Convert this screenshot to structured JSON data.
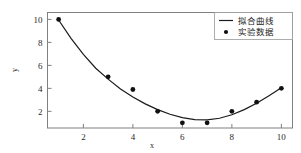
{
  "chart_data": {
    "type": "scatter",
    "title": "",
    "xlabel": "x",
    "ylabel": "y",
    "xlim": [
      0.55,
      10.45
    ],
    "ylim": [
      0.55,
      10.6
    ],
    "xticks": [
      2,
      4,
      6,
      8,
      10
    ],
    "yticks": [
      2,
      4,
      6,
      8,
      10
    ],
    "grid": false,
    "legend_position": "upper right",
    "series": [
      {
        "name": "拟合曲线",
        "type": "line",
        "marker": "line-sample",
        "color": "#1a1a1a",
        "equation_note": "quadratic fit",
        "x": [
          1.0,
          1.5,
          2.0,
          2.5,
          3.0,
          3.5,
          4.0,
          4.5,
          5.0,
          5.5,
          6.0,
          6.5,
          7.0,
          7.5,
          8.0,
          8.5,
          9.0,
          9.5,
          10.0
        ],
        "values": [
          9.95,
          8.35,
          6.95,
          5.75,
          4.8,
          3.95,
          3.25,
          2.65,
          2.15,
          1.75,
          1.45,
          1.28,
          1.25,
          1.4,
          1.7,
          2.15,
          2.7,
          3.35,
          4.05
        ]
      },
      {
        "name": "实验数据",
        "type": "scatter",
        "marker": "filled-circle",
        "color": "#111111",
        "x": [
          1,
          3,
          4,
          5,
          6,
          7,
          8,
          9,
          10
        ],
        "values": [
          10.0,
          5.0,
          3.9,
          2.0,
          1.0,
          1.0,
          2.0,
          2.8,
          4.0
        ]
      }
    ]
  },
  "legend": {
    "entries": [
      {
        "label": "拟合曲线",
        "marker": "line"
      },
      {
        "label": "实验数据",
        "marker": "dot"
      }
    ]
  },
  "axes": {
    "x_title": "x",
    "y_title": "y",
    "x_tick_labels": [
      "2",
      "4",
      "6",
      "8",
      "10"
    ],
    "y_tick_labels": [
      "2",
      "4",
      "6",
      "8",
      "10"
    ]
  },
  "colors": {
    "curve": "#1a1a1a",
    "points": "#111111",
    "frame": "#808080",
    "background": "#ffffff"
  }
}
